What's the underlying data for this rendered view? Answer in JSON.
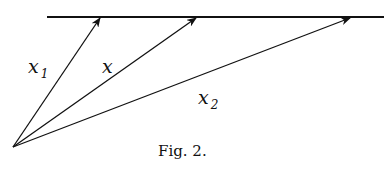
{
  "figure": {
    "caption": "Fig. 2.",
    "labels": {
      "x1": {
        "main": "x",
        "sub": "1"
      },
      "x": {
        "main": "x"
      },
      "x2": {
        "main": "x",
        "sub": "2"
      }
    }
  }
}
